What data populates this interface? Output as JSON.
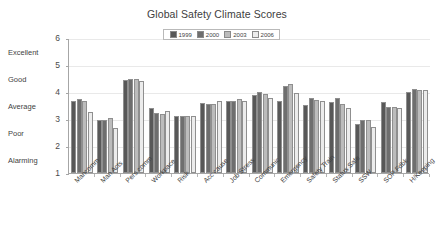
{
  "chart_data": {
    "type": "bar",
    "title": "Global Safety Climate Scores",
    "xlabel": "",
    "ylabel": "",
    "ylim": [
      1,
      6
    ],
    "yticks": [
      1,
      2,
      3,
      4,
      5,
      6
    ],
    "ytick_labels": [
      "1",
      "2",
      "3",
      "4",
      "5",
      "6"
    ],
    "y_category_labels": [
      "Alarming",
      "Poor",
      "Average",
      "Good",
      "Excellent"
    ],
    "grid": true,
    "legend_position": "top-center",
    "categories": [
      "Mancomm",
      "Man Acts",
      "Pers comm",
      "Workpace",
      "Risk",
      "Acc cause",
      "Job Stress",
      "Communic",
      "Emergency",
      "Safety Train",
      "Status Safe",
      "SSW",
      "SOP Fdbk",
      "H/Keeping"
    ],
    "series": [
      {
        "name": "1999",
        "color": "#585858",
        "values": [
          3.65,
          2.95,
          4.45,
          3.4,
          3.12,
          3.6,
          3.65,
          3.88,
          3.68,
          3.52,
          3.62,
          2.8,
          3.62,
          4.0
        ]
      },
      {
        "name": "2000",
        "color": "#6e6e6e",
        "values": [
          3.75,
          2.95,
          4.5,
          3.22,
          3.12,
          3.55,
          3.65,
          4.0,
          4.22,
          3.78,
          3.78,
          2.95,
          3.45,
          4.1
        ]
      },
      {
        "name": "2003",
        "color": "#bcbcbc",
        "values": [
          3.65,
          3.05,
          4.5,
          3.2,
          3.1,
          3.55,
          3.75,
          3.92,
          4.3,
          3.7,
          3.55,
          2.95,
          3.45,
          4.08
        ]
      },
      {
        "name": "2006",
        "color": "#ececec",
        "values": [
          3.25,
          2.65,
          4.4,
          3.3,
          3.1,
          3.65,
          3.65,
          3.78,
          3.98,
          3.65,
          3.4,
          2.72,
          3.4,
          4.08
        ]
      }
    ]
  },
  "legend": {
    "items": [
      {
        "label": "1999",
        "color": "#585858"
      },
      {
        "label": "2000",
        "color": "#6e6e6e"
      },
      {
        "label": "2003",
        "color": "#bcbcbc"
      },
      {
        "label": "2006",
        "color": "#ececec"
      }
    ]
  },
  "colors": {
    "axis": "#a6a6a6",
    "grid": "#e9e9e9",
    "text": "#3f3f3f",
    "background": "#ffffff"
  }
}
